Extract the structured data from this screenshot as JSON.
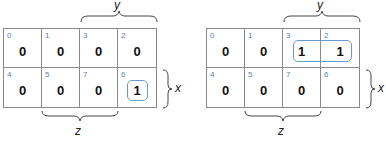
{
  "maps": [
    {
      "cells": [
        {
          "index": "0",
          "value": "0"
        },
        {
          "index": "1",
          "value": "0"
        },
        {
          "index": "3",
          "value": "0"
        },
        {
          "index": "2",
          "value": "0"
        },
        {
          "index": "4",
          "value": "0"
        },
        {
          "index": "5",
          "value": "0"
        },
        {
          "index": "7",
          "value": "0"
        },
        {
          "index": "6",
          "value": "1"
        }
      ],
      "labels": {
        "y": "y",
        "x": "x",
        "z": "z"
      }
    },
    {
      "cells": [
        {
          "index": "0",
          "value": "0"
        },
        {
          "index": "1",
          "value": "0"
        },
        {
          "index": "3",
          "value": "1"
        },
        {
          "index": "2",
          "value": "1"
        },
        {
          "index": "4",
          "value": "0"
        },
        {
          "index": "5",
          "value": "0"
        },
        {
          "index": "7",
          "value": "0"
        },
        {
          "index": "6",
          "value": "0"
        }
      ],
      "labels": {
        "y": "y",
        "x": "x",
        "z": "z"
      }
    }
  ],
  "colors": {
    "grid": "#8a8a8a",
    "index": "#5a82b8",
    "loop": "#6a9bd0"
  }
}
